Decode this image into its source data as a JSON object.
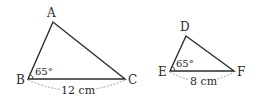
{
  "colors": {
    "stroke": "#2b2b2b",
    "text": "#2a2a2a",
    "dashed": "#9a9a9a",
    "background": "#ffffff"
  },
  "triangles": [
    {
      "id": "ABC",
      "vertices": {
        "A": {
          "label": "A",
          "x": 53,
          "y": 22
        },
        "B": {
          "label": "B",
          "x": 28,
          "y": 79
        },
        "C": {
          "label": "C",
          "x": 125,
          "y": 79
        }
      },
      "angle": {
        "at": "B",
        "label": "65°"
      },
      "base": {
        "from": "B",
        "to": "C",
        "label": "12 cm"
      }
    },
    {
      "id": "DEF",
      "vertices": {
        "D": {
          "label": "D",
          "x": 186,
          "y": 36
        },
        "E": {
          "label": "E",
          "x": 170,
          "y": 71
        },
        "F": {
          "label": "F",
          "x": 234,
          "y": 71
        }
      },
      "angle": {
        "at": "E",
        "label": "65°"
      },
      "base": {
        "from": "E",
        "to": "F",
        "label": "8 cm"
      }
    }
  ]
}
